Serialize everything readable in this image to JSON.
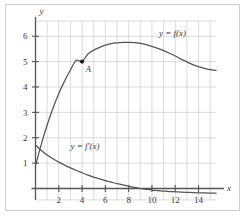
{
  "figure": {
    "title": "",
    "background_color": "#ffffff",
    "frame_color": "#cfcfcf",
    "grid_color": "#cccccc",
    "axis_color": "#555555",
    "curve_color": "#555555",
    "point_color": "#1a1a1a"
  },
  "axes": {
    "x_axis_label": "x",
    "y_axis_label": "y",
    "x_tick_labels": [
      "2",
      "4",
      "6",
      "8",
      "10",
      "12",
      "14"
    ],
    "y_tick_labels": [
      "1",
      "2",
      "3",
      "4",
      "5",
      "6"
    ]
  },
  "annotations": {
    "f_label": "y = f(x)",
    "fprime_label": "y = f′(x)",
    "point_label": "A"
  },
  "chart_data": {
    "type": "line",
    "title": "",
    "xlabel": "x",
    "ylabel": "y",
    "xlim": [
      0,
      15.5
    ],
    "ylim": [
      -0.45,
      6.6
    ],
    "grid": true,
    "grid_step_x": 1,
    "grid_step_y": 1,
    "xticks": [
      2,
      4,
      6,
      8,
      10,
      12,
      14
    ],
    "yticks": [
      1,
      2,
      3,
      4,
      5,
      6
    ],
    "legend": "inline-labels",
    "series": [
      {
        "name": "y = f(x)",
        "label_position": [
          10.6,
          6.0
        ],
        "x": [
          0,
          0.5,
          1,
          1.5,
          2,
          2.5,
          3,
          3.5,
          4,
          4.5,
          5,
          5.5,
          6,
          6.5,
          7,
          7.5,
          8,
          8.5,
          9,
          9.5,
          10,
          10.5,
          11,
          11.5,
          12,
          12.5,
          13,
          13.5,
          14,
          14.5,
          15,
          15.5
        ],
        "values": [
          0.9,
          1.75,
          2.5,
          3.16,
          3.74,
          4.24,
          4.67,
          5.05,
          5.0,
          5.3,
          5.45,
          5.56,
          5.65,
          5.71,
          5.74,
          5.76,
          5.76,
          5.75,
          5.72,
          5.67,
          5.6,
          5.52,
          5.43,
          5.33,
          5.22,
          5.1,
          4.99,
          4.88,
          4.8,
          4.73,
          4.68,
          4.65
        ]
      },
      {
        "name": "y = f'(x)",
        "label_position": [
          3.0,
          1.55
        ],
        "x": [
          0,
          0.5,
          1,
          1.5,
          2,
          2.5,
          3,
          3.5,
          4,
          4.5,
          5,
          5.5,
          6,
          6.5,
          7,
          7.5,
          8,
          8.5,
          9,
          9.5,
          10,
          10.5,
          11,
          11.5,
          12,
          12.5,
          13,
          13.5,
          14,
          14.5,
          15,
          15.5
        ],
        "values": [
          1.72,
          1.5,
          1.32,
          1.17,
          1.04,
          0.92,
          0.81,
          0.71,
          0.62,
          0.53,
          0.45,
          0.38,
          0.31,
          0.25,
          0.19,
          0.14,
          0.09,
          0.04,
          0.0,
          -0.03,
          -0.06,
          -0.08,
          -0.1,
          -0.12,
          -0.13,
          -0.14,
          -0.15,
          -0.16,
          -0.17,
          -0.175,
          -0.18,
          -0.185
        ]
      }
    ],
    "points": [
      {
        "label": "A",
        "x": 4,
        "y": 5,
        "series": "y = f(x)"
      }
    ]
  }
}
